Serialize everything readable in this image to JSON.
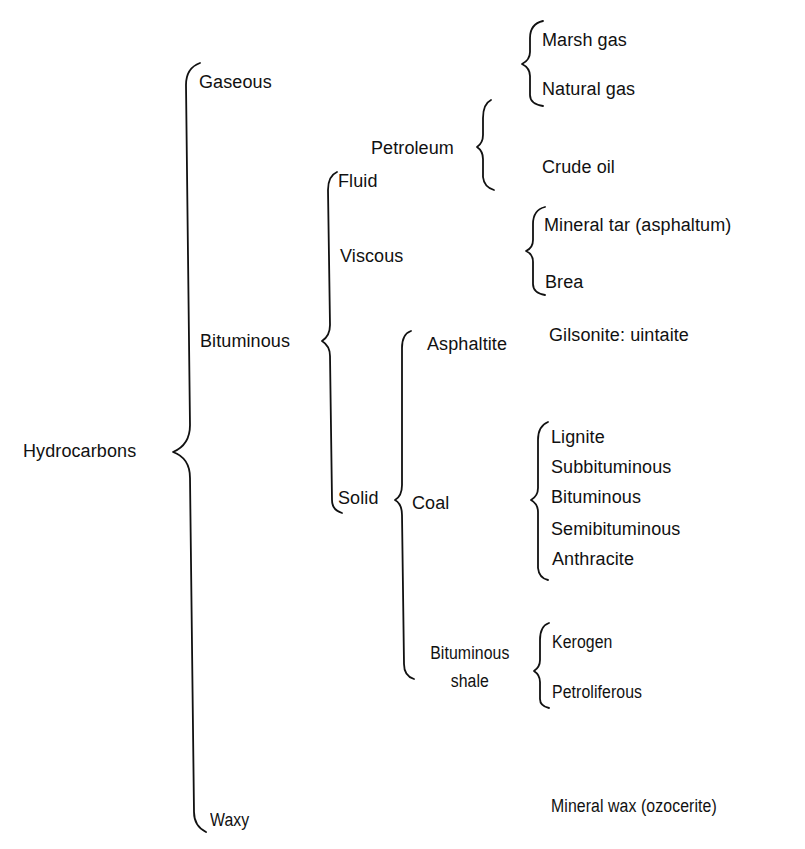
{
  "diagram": {
    "root": "Hydrocarbons",
    "level1": {
      "gaseous": "Gaseous",
      "bituminous": "Bituminous",
      "waxy": "Waxy"
    },
    "gaseous_children": [
      "Marsh gas",
      "Natural gas"
    ],
    "bituminous_children": {
      "fluid": "Fluid",
      "viscous": "Viscous",
      "solid": "Solid"
    },
    "petroleum": "Petroleum",
    "petroleum_children": [
      "Crude oil"
    ],
    "viscous_children": [
      "Mineral tar (asphaltum)",
      "Brea"
    ],
    "solid_children": {
      "asphaltite": "Asphaltite",
      "coal": "Coal",
      "bituminous_shale_line1": "Bituminous",
      "bituminous_shale_line2": "shale"
    },
    "asphaltite_children": [
      "Gilsonite: uintaite"
    ],
    "coal_children": [
      "Lignite",
      "Subbituminous",
      "Bituminous",
      "Semibituminous",
      "Anthracite"
    ],
    "shale_children": [
      "Kerogen",
      "Petroliferous"
    ],
    "waxy_children": [
      "Mineral wax (ozocerite)"
    ]
  }
}
